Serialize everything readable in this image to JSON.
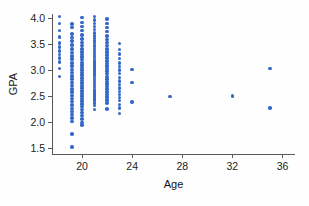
{
  "chart_data": {
    "type": "scatter",
    "title": "",
    "xlabel": "Age",
    "ylabel": "GPA",
    "xlim": [
      17.6,
      37.0
    ],
    "ylim": [
      1.38,
      4.08
    ],
    "xticks": [
      20,
      24,
      28,
      32,
      36
    ],
    "xtick_labels": [
      "20",
      "24",
      "28",
      "32",
      "36"
    ],
    "yticks": [
      1.5,
      2.0,
      2.5,
      3.0,
      3.5,
      4.0
    ],
    "ytick_labels": [
      "1.5",
      "2.0",
      "2.5",
      "3.0",
      "3.5",
      "4.0"
    ],
    "grid": false,
    "legend": null,
    "marker_color": "#3468c8",
    "marker_size": 3.6,
    "n_points": 201,
    "points": [
      [
        18.2,
        3.99
      ],
      [
        18.2,
        3.86
      ],
      [
        18.2,
        3.72
      ],
      [
        18.2,
        3.6
      ],
      [
        18.2,
        3.48
      ],
      [
        18.2,
        3.4
      ],
      [
        18.2,
        3.33
      ],
      [
        18.2,
        3.26
      ],
      [
        18.2,
        3.19
      ],
      [
        18.2,
        3.12
      ],
      [
        18.2,
        2.99
      ],
      [
        18.2,
        2.84
      ],
      [
        19.2,
        3.85
      ],
      [
        19.2,
        3.78
      ],
      [
        19.2,
        3.66
      ],
      [
        19.2,
        3.59
      ],
      [
        19.2,
        3.52
      ],
      [
        19.2,
        3.44
      ],
      [
        19.2,
        3.37
      ],
      [
        19.2,
        3.3
      ],
      [
        19.2,
        3.23
      ],
      [
        19.2,
        3.17
      ],
      [
        19.2,
        3.1
      ],
      [
        19.2,
        3.04
      ],
      [
        19.2,
        2.97
      ],
      [
        19.2,
        2.91
      ],
      [
        19.2,
        2.85
      ],
      [
        19.2,
        2.79
      ],
      [
        19.2,
        2.72
      ],
      [
        19.2,
        2.66
      ],
      [
        19.2,
        2.6
      ],
      [
        19.2,
        2.54
      ],
      [
        19.2,
        2.47
      ],
      [
        19.2,
        2.41
      ],
      [
        19.2,
        2.35
      ],
      [
        19.2,
        2.29
      ],
      [
        19.2,
        2.22
      ],
      [
        19.2,
        2.16
      ],
      [
        19.2,
        2.1
      ],
      [
        19.2,
        2.04
      ],
      [
        19.2,
        1.97
      ],
      [
        19.2,
        1.73
      ],
      [
        19.2,
        1.48
      ],
      [
        20.0,
        3.97
      ],
      [
        20.0,
        3.88
      ],
      [
        20.0,
        3.8
      ],
      [
        20.0,
        3.72
      ],
      [
        20.0,
        3.64
      ],
      [
        20.0,
        3.56
      ],
      [
        20.0,
        3.49
      ],
      [
        20.0,
        3.43
      ],
      [
        20.0,
        3.37
      ],
      [
        20.0,
        3.31
      ],
      [
        20.0,
        3.26
      ],
      [
        20.0,
        3.21
      ],
      [
        20.0,
        3.16
      ],
      [
        20.0,
        3.11
      ],
      [
        20.0,
        3.06
      ],
      [
        20.0,
        3.01
      ],
      [
        20.0,
        2.96
      ],
      [
        20.0,
        2.91
      ],
      [
        20.0,
        2.86
      ],
      [
        20.0,
        2.81
      ],
      [
        20.0,
        2.76
      ],
      [
        20.0,
        2.71
      ],
      [
        20.0,
        2.66
      ],
      [
        20.0,
        2.61
      ],
      [
        20.0,
        2.56
      ],
      [
        20.0,
        2.51
      ],
      [
        20.0,
        2.46
      ],
      [
        20.0,
        2.41
      ],
      [
        20.0,
        2.36
      ],
      [
        20.0,
        2.31
      ],
      [
        20.0,
        2.26
      ],
      [
        20.0,
        2.2
      ],
      [
        20.0,
        2.14
      ],
      [
        20.0,
        2.08
      ],
      [
        20.0,
        2.02
      ],
      [
        20.0,
        1.95
      ],
      [
        20.0,
        1.9
      ],
      [
        21.0,
        3.99
      ],
      [
        21.0,
        3.93
      ],
      [
        21.0,
        3.86
      ],
      [
        21.0,
        3.8
      ],
      [
        21.0,
        3.74
      ],
      [
        21.0,
        3.68
      ],
      [
        21.0,
        3.62
      ],
      [
        21.0,
        3.57
      ],
      [
        21.0,
        3.52
      ],
      [
        21.0,
        3.47
      ],
      [
        21.0,
        3.42
      ],
      [
        21.0,
        3.38
      ],
      [
        21.0,
        3.34
      ],
      [
        21.0,
        3.3
      ],
      [
        21.0,
        3.26
      ],
      [
        21.0,
        3.22
      ],
      [
        21.0,
        3.18
      ],
      [
        21.0,
        3.14
      ],
      [
        21.0,
        3.1
      ],
      [
        21.0,
        3.06
      ],
      [
        21.0,
        3.02
      ],
      [
        21.0,
        2.98
      ],
      [
        21.0,
        2.94
      ],
      [
        21.0,
        2.9
      ],
      [
        21.0,
        2.86
      ],
      [
        21.0,
        2.82
      ],
      [
        21.0,
        2.78
      ],
      [
        21.0,
        2.74
      ],
      [
        21.0,
        2.7
      ],
      [
        21.0,
        2.66
      ],
      [
        21.0,
        2.62
      ],
      [
        21.0,
        2.58
      ],
      [
        21.0,
        2.54
      ],
      [
        21.0,
        2.5
      ],
      [
        21.0,
        2.46
      ],
      [
        21.0,
        2.42
      ],
      [
        21.0,
        2.38
      ],
      [
        21.0,
        2.33
      ],
      [
        21.0,
        2.28
      ],
      [
        21.0,
        2.2
      ],
      [
        22.0,
        3.94
      ],
      [
        22.0,
        3.86
      ],
      [
        22.0,
        3.78
      ],
      [
        22.0,
        3.7
      ],
      [
        22.0,
        3.62
      ],
      [
        22.0,
        3.55
      ],
      [
        22.0,
        3.49
      ],
      [
        22.0,
        3.43
      ],
      [
        22.0,
        3.37
      ],
      [
        22.0,
        3.31
      ],
      [
        22.0,
        3.25
      ],
      [
        22.0,
        3.19
      ],
      [
        22.0,
        3.14
      ],
      [
        22.0,
        3.09
      ],
      [
        22.0,
        3.04
      ],
      [
        22.0,
        2.99
      ],
      [
        22.0,
        2.94
      ],
      [
        22.0,
        2.89
      ],
      [
        22.0,
        2.84
      ],
      [
        22.0,
        2.79
      ],
      [
        22.0,
        2.74
      ],
      [
        22.0,
        2.69
      ],
      [
        22.0,
        2.64
      ],
      [
        22.0,
        2.59
      ],
      [
        22.0,
        2.54
      ],
      [
        22.0,
        2.49
      ],
      [
        22.0,
        2.44
      ],
      [
        22.0,
        2.38
      ],
      [
        22.0,
        2.32
      ],
      [
        22.0,
        2.21
      ],
      [
        23.0,
        3.47
      ],
      [
        23.0,
        3.36
      ],
      [
        23.0,
        3.27
      ],
      [
        23.0,
        3.18
      ],
      [
        23.0,
        3.1
      ],
      [
        23.0,
        3.03
      ],
      [
        23.0,
        2.96
      ],
      [
        23.0,
        2.89
      ],
      [
        23.0,
        2.82
      ],
      [
        23.0,
        2.75
      ],
      [
        23.0,
        2.68
      ],
      [
        23.0,
        2.61
      ],
      [
        23.0,
        2.55
      ],
      [
        23.0,
        2.49
      ],
      [
        23.0,
        2.43
      ],
      [
        23.0,
        2.37
      ],
      [
        23.0,
        2.3
      ],
      [
        23.0,
        2.23
      ],
      [
        23.0,
        2.12
      ],
      [
        24.0,
        2.97
      ],
      [
        24.0,
        2.72
      ],
      [
        24.0,
        2.34
      ],
      [
        27.0,
        2.45
      ],
      [
        32.0,
        2.46
      ],
      [
        35.0,
        2.99
      ],
      [
        35.0,
        2.23
      ]
    ]
  }
}
